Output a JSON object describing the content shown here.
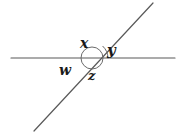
{
  "figure": {
    "type": "geometry-diagram",
    "background_color": "#ffffff",
    "stroke_color": "#4a4a4a",
    "label_color": "#1a1a1a",
    "width": 186,
    "height": 135
  },
  "lines": [
    {
      "name": "horizontal-line",
      "x1": 11,
      "y1": 58,
      "x2": 175,
      "y2": 58,
      "stroke": "#595959",
      "stroke_width": 1.2
    },
    {
      "name": "transversal-line",
      "x1": 34,
      "y1": 131,
      "x2": 153,
      "y2": 3,
      "stroke": "#595959",
      "stroke_width": 1.2
    }
  ],
  "intersection": {
    "name": "intersection-point",
    "x": 92,
    "y": 58
  },
  "arcs": [
    {
      "name": "arc-w-x-z",
      "shape": "circle",
      "cx": 92,
      "cy": 58,
      "r": 11,
      "stroke": "#6b6b6b",
      "stroke_width": 1
    },
    {
      "name": "arc-y",
      "shape": "arc",
      "cx": 92,
      "cy": 58,
      "r": 16,
      "start_angle_deg": 0,
      "end_angle_deg": 47,
      "stroke": "#6b6b6b",
      "stroke_width": 1
    }
  ],
  "labels": [
    {
      "id": "x",
      "text": "x",
      "x": 85,
      "y": 44,
      "position": "top"
    },
    {
      "id": "y",
      "text": "y",
      "x": 113,
      "y": 52,
      "position": "right"
    },
    {
      "id": "w",
      "text": "w",
      "x": 66,
      "y": 71,
      "position": "left"
    },
    {
      "id": "z",
      "text": "z",
      "x": 93,
      "y": 76,
      "position": "bottom"
    }
  ]
}
